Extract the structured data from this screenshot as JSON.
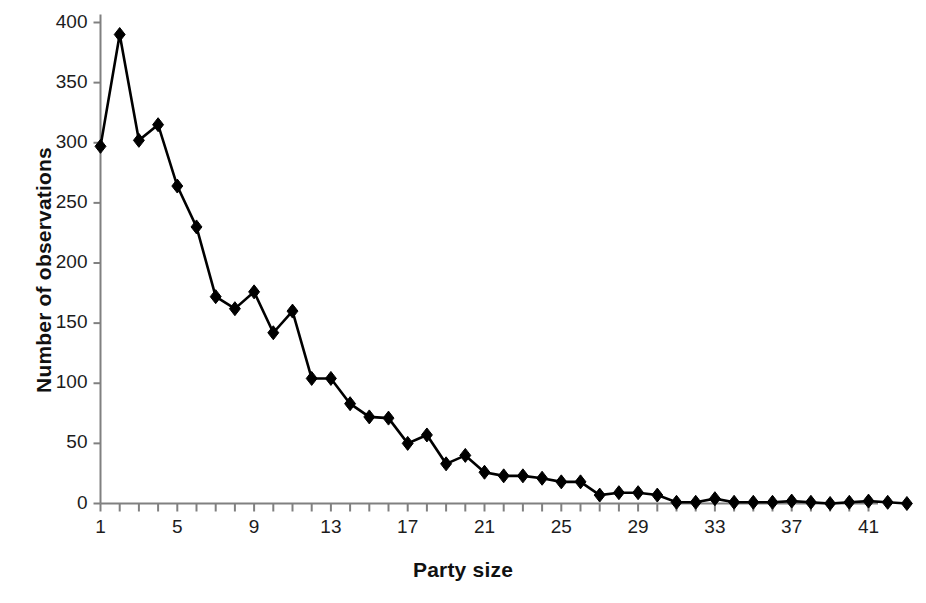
{
  "chart_data": {
    "type": "line",
    "title": "",
    "xlabel": "Party size",
    "ylabel": "Number of observations",
    "x": [
      1,
      2,
      3,
      4,
      5,
      6,
      7,
      8,
      9,
      10,
      11,
      12,
      13,
      14,
      15,
      16,
      17,
      18,
      19,
      20,
      21,
      22,
      23,
      24,
      25,
      26,
      27,
      28,
      29,
      30,
      31,
      32,
      33,
      34,
      35,
      36,
      37,
      38,
      39,
      40,
      41,
      42,
      43
    ],
    "values": [
      297,
      390,
      302,
      315,
      264,
      230,
      172,
      162,
      176,
      142,
      160,
      104,
      104,
      83,
      72,
      71,
      50,
      57,
      33,
      40,
      26,
      23,
      23,
      21,
      18,
      18,
      7,
      9,
      9,
      7,
      1,
      1,
      4,
      1,
      1,
      1,
      2,
      1,
      0,
      1,
      2,
      1,
      0
    ],
    "xlim": [
      0,
      44
    ],
    "ylim": [
      0,
      400
    ],
    "xticks": [
      1,
      2,
      3,
      4,
      5,
      6,
      7,
      8,
      9,
      10,
      11,
      12,
      13,
      14,
      15,
      16,
      17,
      18,
      19,
      20,
      21,
      22,
      23,
      24,
      25,
      26,
      27,
      28,
      29,
      30,
      31,
      32,
      33,
      34,
      35,
      36,
      37,
      38,
      39,
      40,
      41,
      42,
      43
    ],
    "xtick_labels": [
      {
        "value": 1,
        "label": "1"
      },
      {
        "value": 5,
        "label": "5"
      },
      {
        "value": 9,
        "label": "9"
      },
      {
        "value": 13,
        "label": "13"
      },
      {
        "value": 17,
        "label": "17"
      },
      {
        "value": 21,
        "label": "21"
      },
      {
        "value": 25,
        "label": "25"
      },
      {
        "value": 29,
        "label": "29"
      },
      {
        "value": 33,
        "label": "33"
      },
      {
        "value": 37,
        "label": "37"
      },
      {
        "value": 41,
        "label": "41"
      }
    ],
    "yticks": [
      0,
      50,
      100,
      150,
      200,
      250,
      300,
      350,
      400
    ],
    "ytick_labels": [
      "0",
      "50",
      "100",
      "150",
      "200",
      "250",
      "300",
      "350",
      "400"
    ],
    "grid": false,
    "legend": null,
    "series_name": "Number of observations",
    "marker": "diamond",
    "line_color": "#000000",
    "marker_color": "#000000",
    "axis_color": "#808080",
    "background_color": "#ffffff",
    "line_width": 2.6,
    "marker_size": 7
  }
}
